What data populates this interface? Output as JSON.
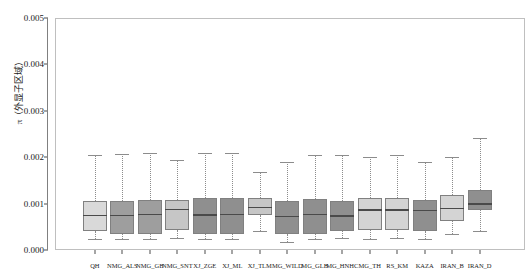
{
  "chart_data": {
    "type": "box",
    "title": "",
    "xlabel": "",
    "ylabel": "π（外显子区域）",
    "ylim": [
      0.0,
      0.005
    ],
    "yticks": [
      "0.000",
      "0.001",
      "0.002",
      "0.003",
      "0.004",
      "0.005"
    ],
    "ytick_values": [
      0.0,
      0.001,
      0.002,
      0.003,
      0.004,
      0.005
    ],
    "grid": false,
    "legend": "none",
    "categories": [
      "QH",
      "NMG_ALS",
      "NMG_GB",
      "NMG_SNT",
      "XJ_ZGE",
      "XJ_ML",
      "XJ_TLM",
      "MG_WILD",
      "MG_GLB",
      "MG_HNHC",
      "MG_TH",
      "RS_KM",
      "KAZA",
      "IRAN_B",
      "IRAN_D"
    ],
    "boxes": [
      {
        "name": "QH",
        "min": 0.000245,
        "q1": 0.000415,
        "median": 0.000755,
        "q3": 0.001055,
        "max": 0.002055,
        "color": "#d9d9d9"
      },
      {
        "name": "NMG_ALS",
        "min": 0.000235,
        "q1": 0.00035,
        "median": 0.00076,
        "q3": 0.00106,
        "max": 0.00206,
        "color": "#9e9e9e"
      },
      {
        "name": "NMG_GB",
        "min": 0.00024,
        "q1": 0.000345,
        "median": 0.000775,
        "q3": 0.00107,
        "max": 0.002085,
        "color": "#9e9e9e"
      },
      {
        "name": "NMG_SNT",
        "min": 0.00025,
        "q1": 0.000425,
        "median": 0.000885,
        "q3": 0.001075,
        "max": 0.00193,
        "color": "#c6c6c6"
      },
      {
        "name": "XJ_ZGE",
        "min": 0.000235,
        "q1": 0.000345,
        "median": 0.00077,
        "q3": 0.00111,
        "max": 0.00209,
        "color": "#8f8f8f"
      },
      {
        "name": "XJ_ML",
        "min": 0.00024,
        "q1": 0.00035,
        "median": 0.000775,
        "q3": 0.001115,
        "max": 0.00209,
        "color": "#8f8f8f"
      },
      {
        "name": "XJ_TLM",
        "min": 0.00041,
        "q1": 0.00076,
        "median": 0.00093,
        "q3": 0.00112,
        "max": 0.00169,
        "color": "#c6c6c6"
      },
      {
        "name": "MG_WILD",
        "min": 0.00017,
        "q1": 0.000345,
        "median": 0.00074,
        "q3": 0.001055,
        "max": 0.0019,
        "color": "#8f8f8f"
      },
      {
        "name": "MG_GLB",
        "min": 0.000235,
        "q1": 0.00035,
        "median": 0.000775,
        "q3": 0.00109,
        "max": 0.00205,
        "color": "#8f8f8f"
      },
      {
        "name": "MG_HNHC",
        "min": 0.00025,
        "q1": 0.00041,
        "median": 0.00075,
        "q3": 0.00105,
        "max": 0.00205,
        "color": "#8f8f8f"
      },
      {
        "name": "MG_TH",
        "min": 0.000245,
        "q1": 0.000435,
        "median": 0.000875,
        "q3": 0.00112,
        "max": 0.002,
        "color": "#d4d4d4"
      },
      {
        "name": "RS_KM",
        "min": 0.00025,
        "q1": 0.000425,
        "median": 0.000875,
        "q3": 0.001115,
        "max": 0.002055,
        "color": "#d4d4d4"
      },
      {
        "name": "KAZA",
        "min": 0.00024,
        "q1": 0.000415,
        "median": 0.000865,
        "q3": 0.001075,
        "max": 0.00189,
        "color": "#8f8f8f"
      },
      {
        "name": "IRAN_B",
        "min": 0.000355,
        "q1": 0.00062,
        "median": 0.00091,
        "q3": 0.00118,
        "max": 0.002015,
        "color": "#d4d4d4"
      },
      {
        "name": "IRAN_D",
        "min": 0.0004,
        "q1": 0.000855,
        "median": 0.00101,
        "q3": 0.001295,
        "max": 0.00242,
        "color": "#8f8f8f"
      }
    ],
    "extra_ticks": [
      "",
      "",
      ""
    ]
  },
  "colors": {
    "frame": "#bfbfbf",
    "axis": "#808080",
    "whisker": "#8c8c8c",
    "median": "#4a4a4a",
    "text": "#1a1a1a",
    "background": "#ffffff"
  }
}
